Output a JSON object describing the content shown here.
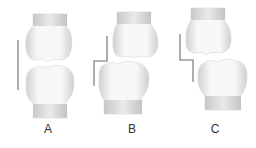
{
  "panels": [
    {
      "label": "A",
      "description": "upper and lower shapes aligned, straight vertical line"
    },
    {
      "label": "B",
      "description": "lower shape shifted left, stepped line"
    },
    {
      "label": "C",
      "description": "lower shape shifted right, stepped line"
    }
  ],
  "colors": {
    "fill": "#f4f4f4",
    "shade": "#cfcfcf",
    "line": "#9a9a9a",
    "label": "#333333"
  }
}
